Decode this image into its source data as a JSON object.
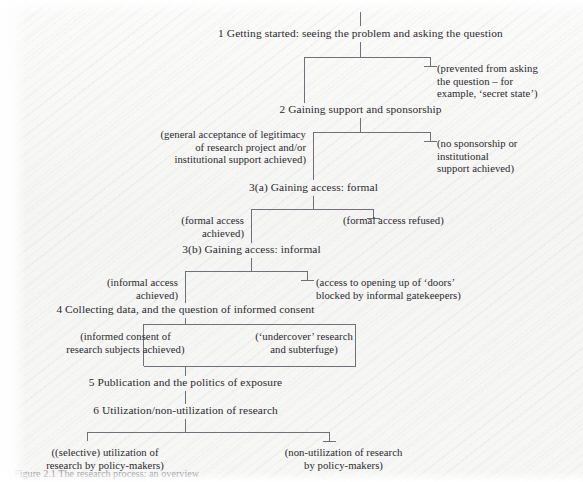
{
  "figure": {
    "background_color": "#f7f7f6",
    "line_color": "#6b6b72",
    "text_color": "#2a2a2e",
    "caption": "Figure 2.1  The research process: an overview"
  },
  "stages": [
    {
      "id": "stage-1",
      "label": "1  Getting started: seeing the problem and asking the question"
    },
    {
      "id": "stage-2",
      "label": "2  Gaining support and sponsorship"
    },
    {
      "id": "stage-3a",
      "label": "3(a)  Gaining access: formal"
    },
    {
      "id": "stage-3b",
      "label": "3(b) Gaining access: informal"
    },
    {
      "id": "stage-4",
      "label": "4  Collecting data, and the question of informed consent"
    },
    {
      "id": "stage-5",
      "label": "5  Publication and the politics of exposure"
    },
    {
      "id": "stage-6",
      "label": "6  Utilization/non-utilization of research"
    }
  ],
  "outcomes": [
    {
      "id": "outcome-prevented",
      "label": "(prevented from asking\nthe question – for\nexample, ‘secret state’)"
    },
    {
      "id": "outcome-general-acceptance",
      "label": "(general acceptance of legitimacy\nof research project and/or\ninstitutional support achieved)"
    },
    {
      "id": "outcome-no-sponsorship",
      "label": "(no sponsorship or\ninstitutional\nsupport achieved)"
    },
    {
      "id": "outcome-formal-access-achieved",
      "label": "(formal access\nachieved)"
    },
    {
      "id": "outcome-formal-access-refused",
      "label": "(formal access refused)"
    },
    {
      "id": "outcome-informal-access-achieved",
      "label": "(informal access\nachieved)"
    },
    {
      "id": "outcome-access-blocked",
      "label": "(access to opening up of ‘doors’\nblocked by informal gatekeepers)"
    },
    {
      "id": "outcome-informed-consent",
      "label": "(informed consent of\nresearch subjects achieved)"
    },
    {
      "id": "outcome-undercover",
      "label": "(‘undercover’ research\nand subterfuge)"
    },
    {
      "id": "outcome-selective-utilization",
      "label": "((selective) utilization of\nresearch by policy-makers)"
    },
    {
      "id": "outcome-non-utilization",
      "label": "(non-utilization of research\nby policy-makers)"
    }
  ]
}
